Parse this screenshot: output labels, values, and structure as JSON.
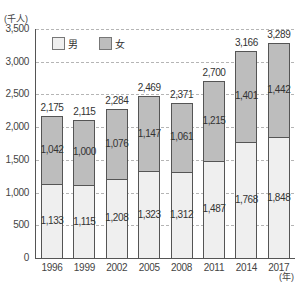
{
  "chart_data": {
    "type": "bar",
    "stacked": true,
    "title": "",
    "xlabel": "(年)",
    "ylabel": "(千人)",
    "ylim": [
      0,
      3500
    ],
    "yticks": [
      "0",
      "500",
      "1,000",
      "1,500",
      "2,000",
      "2,500",
      "3,000",
      "3,500"
    ],
    "grid": true,
    "legend_position": "top-left inside",
    "categories": [
      "1996",
      "1999",
      "2002",
      "2005",
      "2008",
      "2011",
      "2014",
      "2017"
    ],
    "series": [
      {
        "name": "男",
        "color": "#efefef",
        "values": [
          1133,
          1115,
          1208,
          1323,
          1312,
          1487,
          1768,
          1848
        ],
        "labels": [
          "1,133",
          "1,115",
          "1,208",
          "1,323",
          "1,312",
          "1,487",
          "1,768",
          "1,848"
        ]
      },
      {
        "name": "女",
        "color": "#bdbdbd",
        "values": [
          1042,
          1000,
          1076,
          1147,
          1061,
          1215,
          1401,
          1442
        ],
        "labels": [
          "1,042",
          "1,000",
          "1,076",
          "1,147",
          "1,061",
          "1,215",
          "1,401",
          "1,442"
        ]
      }
    ],
    "totals": [
      2175,
      2115,
      2284,
      2469,
      2371,
      2700,
      3166,
      3289
    ],
    "total_labels": [
      "2,175",
      "2,115",
      "2,284",
      "2,469",
      "2,371",
      "2,700",
      "3,166",
      "3,289"
    ]
  },
  "axis": {
    "unit_y": "(千人)",
    "unit_x": "(年)"
  },
  "legend": {
    "male": "男",
    "female": "女"
  }
}
